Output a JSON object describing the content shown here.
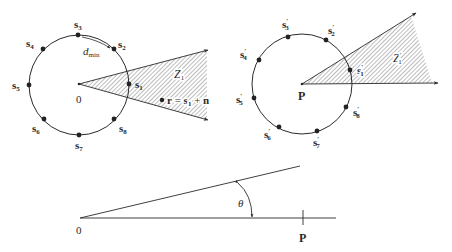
{
  "figure": {
    "left_panel": {
      "origin_label": "0",
      "points": [
        {
          "label": "s",
          "sub": "1"
        },
        {
          "label": "s",
          "sub": "2"
        },
        {
          "label": "s",
          "sub": "3"
        },
        {
          "label": "s",
          "sub": "4"
        },
        {
          "label": "s",
          "sub": "5"
        },
        {
          "label": "s",
          "sub": "6"
        },
        {
          "label": "s",
          "sub": "7"
        },
        {
          "label": "s",
          "sub": "8"
        }
      ],
      "dmin_label": "d",
      "dmin_sub": "min",
      "region_label": "Z",
      "region_sub": "1",
      "received_label_r": "r",
      "received_label_eq": " = ",
      "received_label_s": "s",
      "received_label_s_sub": "1",
      "received_label_plus": " + ",
      "received_label_n": "n"
    },
    "right_panel": {
      "origin_label": "P",
      "points": [
        {
          "label": "s",
          "sub": "1",
          "prime": "′"
        },
        {
          "label": "s",
          "sub": "2",
          "prime": "′"
        },
        {
          "label": "s",
          "sub": "3",
          "prime": "′"
        },
        {
          "label": "s",
          "sub": "4",
          "prime": "′"
        },
        {
          "label": "s",
          "sub": "5",
          "prime": "′"
        },
        {
          "label": "s",
          "sub": "6",
          "prime": "′"
        },
        {
          "label": "s",
          "sub": "7",
          "prime": "′"
        },
        {
          "label": "s",
          "sub": "8",
          "prime": "′"
        }
      ],
      "region_label": "Z",
      "region_sub": "1",
      "region_prime": "′"
    },
    "bottom_panel": {
      "origin_label": "0",
      "point_label": "P",
      "angle_label": "θ"
    },
    "colors": {
      "ink": "#2a2a2a",
      "hatch": "#6a6a6a",
      "background": "#ffffff"
    }
  }
}
